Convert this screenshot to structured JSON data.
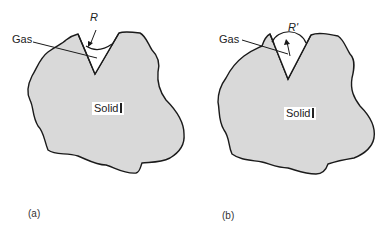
{
  "panels": [
    {
      "id": "a",
      "caption": "(a)",
      "gas_label": "Gas",
      "solid_label": "Solid",
      "radius_label": "R",
      "meniscus": "concave"
    },
    {
      "id": "b",
      "caption": "(b)",
      "gas_label": "Gas",
      "solid_label": "Solid",
      "radius_label": "R'",
      "meniscus": "convex"
    }
  ],
  "colors": {
    "solid_fill": "#d9d9d9",
    "outline": "#1a1a1a",
    "background": "#ffffff"
  }
}
